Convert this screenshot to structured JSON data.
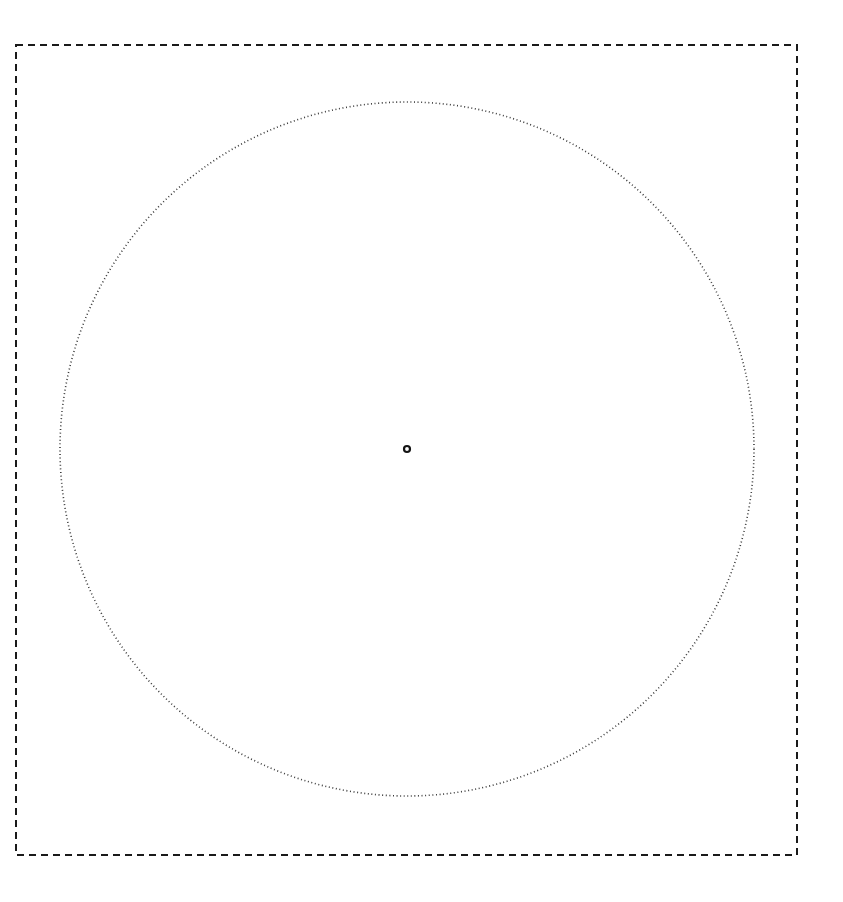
{
  "canvas": {
    "width": 843,
    "height": 902,
    "background_color": "#ffffff",
    "title": "Geometry Canvas"
  },
  "figure": {
    "bounding_box": {
      "name": "bounding-box",
      "shape": "rectangle",
      "x": 16,
      "y": 45,
      "width": 781,
      "height": 810,
      "stroke_color": "#1a1a1a",
      "stroke_width": 2,
      "stroke_style": "dashed",
      "dash_length": 7,
      "dash_gap": 5,
      "fill": "none"
    },
    "circle": {
      "name": "inscribed-circle",
      "shape": "circle",
      "center_x": 407,
      "center_y": 449,
      "radius": 347,
      "diameter": 694,
      "stroke_color": "#3a3a3a",
      "stroke_width": 1.6,
      "stroke_style": "dotted",
      "dot_length": 1,
      "dot_gap": 2.6,
      "fill": "none"
    },
    "center_marker": {
      "name": "center-point-marker",
      "shape": "ring",
      "center_x": 407,
      "center_y": 449,
      "radius": 3,
      "stroke_color": "#141414",
      "stroke_width": 2.2,
      "fill": "none"
    }
  }
}
